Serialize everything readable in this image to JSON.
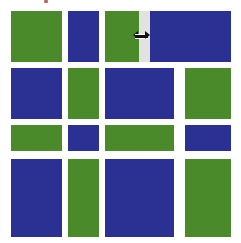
{
  "canvas": {
    "width": 241,
    "height": 243,
    "background": "#ffffff"
  },
  "palette": {
    "green": "#4a8a2a",
    "blue": "#2b3192",
    "splitter_gray": "#e2e2e0",
    "cursor_black": "#111111",
    "white": "#ffffff"
  },
  "top_strip": {
    "clipped_label": "clipped-toolbar-text",
    "visible": true
  },
  "cursor": {
    "name": "horizontal-resize-cursor",
    "glyph": "↔",
    "x": 133,
    "y": 31,
    "width": 17,
    "height": 9
  },
  "splitter": {
    "name": "pane-splitter",
    "x": 139,
    "y": 11,
    "width": 11,
    "height": 51,
    "color": "#e2e2e0"
  },
  "grid": {
    "rows": [
      {
        "name": "row-1",
        "y": 11,
        "height": 51,
        "blocks": [
          {
            "id": "r1c1",
            "color": "green",
            "x": 11,
            "width": 51
          },
          {
            "id": "r1c2",
            "color": "blue",
            "x": 68,
            "width": 31
          },
          {
            "id": "r1c3",
            "color": "green",
            "x": 105,
            "width": 34
          },
          {
            "id": "r1c4",
            "color": "blue",
            "x": 150,
            "width": 81
          }
        ]
      },
      {
        "name": "row-2",
        "y": 68,
        "height": 51,
        "blocks": [
          {
            "id": "r2c1",
            "color": "blue",
            "x": 11,
            "width": 51
          },
          {
            "id": "r2c2",
            "color": "green",
            "x": 68,
            "width": 31
          },
          {
            "id": "r2c3",
            "color": "blue",
            "x": 105,
            "width": 69
          },
          {
            "id": "r2c4",
            "color": "green",
            "x": 185,
            "width": 46
          }
        ]
      },
      {
        "name": "row-3",
        "y": 125,
        "height": 26,
        "blocks": [
          {
            "id": "r3c1",
            "color": "green",
            "x": 11,
            "width": 51
          },
          {
            "id": "r3c2",
            "color": "blue",
            "x": 68,
            "width": 31
          },
          {
            "id": "r3c3",
            "color": "green",
            "x": 105,
            "width": 69
          },
          {
            "id": "r3c4",
            "color": "blue",
            "x": 185,
            "width": 46
          }
        ]
      },
      {
        "name": "row-4",
        "y": 159,
        "height": 78,
        "blocks": [
          {
            "id": "r4c1",
            "color": "blue",
            "x": 11,
            "width": 51
          },
          {
            "id": "r4c2",
            "color": "green",
            "x": 68,
            "width": 31
          },
          {
            "id": "r4c3",
            "color": "blue",
            "x": 105,
            "width": 69
          },
          {
            "id": "r4c4",
            "color": "green",
            "x": 185,
            "width": 46
          }
        ]
      }
    ]
  }
}
